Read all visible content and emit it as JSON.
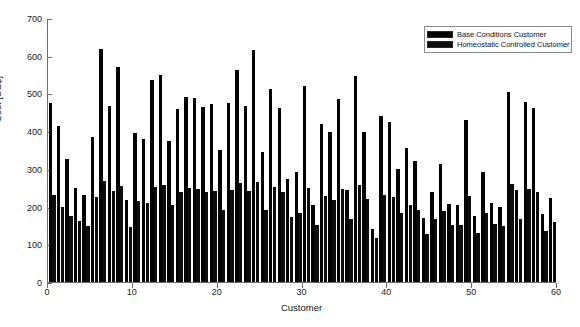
{
  "figure": {
    "background": "#ffffff",
    "bar_color": "#000000"
  },
  "axis": {
    "x_title": "Customer",
    "y_title": "Cost [US$]",
    "x_ticks": [
      "0",
      "10",
      "20",
      "30",
      "40",
      "50",
      "60"
    ],
    "y_ticks": [
      "0",
      "100",
      "200",
      "300",
      "400",
      "500",
      "600",
      "700"
    ]
  },
  "legend": {
    "entries": [
      {
        "label": "Base Conditions Customer",
        "color": "#000000"
      },
      {
        "label": "Homeostatic Controlled Customer",
        "color": "#0c0c0c"
      }
    ]
  },
  "caption": "",
  "chart_data": {
    "type": "bar",
    "title": "",
    "xlabel": "Customer",
    "ylabel": "Cost [US$]",
    "xlim": [
      0,
      60
    ],
    "ylim": [
      0,
      700
    ],
    "grid": false,
    "legend_position": "top-right",
    "x": [
      1,
      2,
      3,
      4,
      5,
      6,
      7,
      8,
      9,
      10,
      11,
      12,
      13,
      14,
      15,
      16,
      17,
      18,
      19,
      20,
      21,
      22,
      23,
      24,
      25,
      26,
      27,
      28,
      29,
      30,
      31,
      32,
      33,
      34,
      35,
      36,
      37,
      38,
      39,
      40,
      41,
      42,
      43,
      44,
      45,
      46,
      47,
      48,
      49,
      50,
      51,
      52,
      53,
      54,
      55,
      56,
      57,
      58,
      59,
      60
    ],
    "series": [
      {
        "name": "Base Conditions Customer",
        "values": [
          475,
          415,
          325,
          250,
          232,
          385,
          618,
          468,
          570,
          218,
          396,
          380,
          535,
          548,
          375,
          458,
          490,
          488,
          465,
          473,
          350,
          475,
          563,
          468,
          615,
          345,
          512,
          462,
          273,
          292,
          520,
          205,
          420,
          398,
          484,
          245,
          545,
          398,
          140,
          440,
          423,
          300,
          355,
          320,
          170,
          240,
          312,
          208,
          203,
          430,
          175,
          293,
          210,
          200,
          505,
          245,
          478,
          462,
          180,
          222
        ]
      },
      {
        "name": "Homeostatic Controlled Customer",
        "values": [
          232,
          198,
          175,
          162,
          148,
          225,
          268,
          242,
          255,
          145,
          215,
          210,
          252,
          258,
          205,
          238,
          248,
          246,
          240,
          242,
          192,
          244,
          262,
          241,
          266,
          190,
          252,
          239,
          172,
          182,
          250,
          152,
          228,
          218,
          246,
          168,
          258,
          219,
          118,
          231,
          226,
          183,
          205,
          192,
          128,
          166,
          189,
          152,
          150,
          228,
          130,
          184,
          154,
          149,
          259,
          168,
          246,
          240,
          136,
          158
        ]
      }
    ]
  }
}
